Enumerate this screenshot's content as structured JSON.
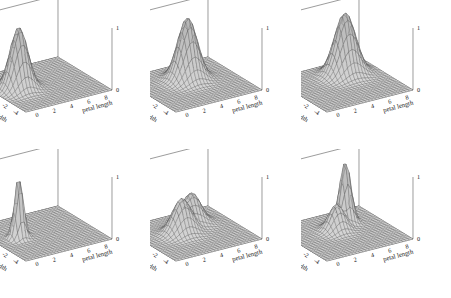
{
  "figure": {
    "background": "#ffffff",
    "rows": 2,
    "cols": 3,
    "line_color": "#4a4a4a",
    "surface_fill": "#d9d9d9",
    "base_fill": "#c9c9c9"
  },
  "axes": {
    "x": {
      "label": "petal length",
      "ticks": [
        "0",
        "2",
        "4",
        "6",
        "8"
      ],
      "range": [
        -1,
        9
      ]
    },
    "y": {
      "label": "petal width",
      "ticks": [
        "4",
        "2",
        "0",
        "-2",
        "-4"
      ],
      "range": [
        -5,
        5
      ]
    },
    "z": {
      "ticks": [
        "1",
        "0"
      ],
      "range": [
        0,
        1
      ]
    },
    "corner_tick": "0"
  },
  "panels": [
    {
      "id": "panel-top-left",
      "species": "Iris setosa",
      "row": 1,
      "col": 1,
      "shape": "unimodal-broad"
    },
    {
      "id": "panel-top-center",
      "species": "Iris versicolor",
      "row": 1,
      "col": 2,
      "shape": "unimodal-broad"
    },
    {
      "id": "panel-top-right",
      "species": "Iris virginica",
      "row": 1,
      "col": 3,
      "shape": "unimodal-broad"
    },
    {
      "id": "panel-bottom-left",
      "species": "Iris setosa",
      "row": 2,
      "col": 1,
      "shape": "unimodal-sharp"
    },
    {
      "id": "panel-bottom-center",
      "species": "Iris versicolor",
      "row": 2,
      "col": 2,
      "shape": "bimodal-ridge"
    },
    {
      "id": "panel-bottom-right",
      "species": "Iris virginica",
      "row": 2,
      "col": 3,
      "shape": "bimodal-peak"
    }
  ],
  "chart_data": {
    "type": "surface",
    "title": "",
    "xlabel": "petal length",
    "ylabel": "petal width",
    "zlabel": "",
    "xlim": [
      -1,
      9
    ],
    "ylim": [
      -5,
      5
    ],
    "zlim": [
      0,
      1
    ],
    "xticks": [
      0,
      2,
      4,
      6,
      8
    ],
    "yticks": [
      4,
      2,
      0,
      -2,
      -4
    ],
    "zticks": [
      0,
      1
    ],
    "grid": true,
    "legend": "none",
    "panel_layout": [
      2,
      3
    ],
    "surfaces": [
      {
        "name": "Iris setosa",
        "panel": "top-left",
        "description": "single smooth peak near petal length 1.5, petal width 0.3, normalized height 1.0",
        "peaks": [
          {
            "x": 1.5,
            "y": 0.3,
            "z": 1.0,
            "sigma_x": 0.9,
            "sigma_y": 0.9
          }
        ]
      },
      {
        "name": "Iris versicolor",
        "panel": "top-center",
        "description": "single smooth peak near petal length 4.3, petal width 1.3, normalized height 1.0",
        "peaks": [
          {
            "x": 4.3,
            "y": 1.3,
            "z": 1.0,
            "sigma_x": 1.0,
            "sigma_y": 1.0
          }
        ]
      },
      {
        "name": "Iris virginica",
        "panel": "top-right",
        "description": "single smooth peak near petal length 5.5, petal width 2.0, normalized height 1.0",
        "peaks": [
          {
            "x": 5.5,
            "y": 2.0,
            "z": 1.0,
            "sigma_x": 1.1,
            "sigma_y": 1.0
          }
        ]
      },
      {
        "name": "Iris setosa",
        "panel": "bottom-left",
        "description": "narrow sharp spike near petal length 1.5, petal width 0.3, normalized height 1.0",
        "peaks": [
          {
            "x": 1.5,
            "y": 0.3,
            "z": 1.0,
            "sigma_x": 0.45,
            "sigma_y": 0.45
          }
        ]
      },
      {
        "name": "Iris versicolor",
        "panel": "bottom-center",
        "description": "broad plateau with two low humps and a central saddle near petal length 4.3, petal width 1.3",
        "peaks": [
          {
            "x": 3.2,
            "y": 0.6,
            "z": 0.55,
            "sigma_x": 1.0,
            "sigma_y": 0.9
          },
          {
            "x": 5.2,
            "y": 2.0,
            "z": 0.5,
            "sigma_x": 1.0,
            "sigma_y": 0.9
          }
        ]
      },
      {
        "name": "Iris virginica",
        "panel": "bottom-right",
        "description": "tall narrow peak with an adjacent lower shoulder near petal length 5.5, petal width 2.0",
        "peaks": [
          {
            "x": 5.6,
            "y": 2.1,
            "z": 1.0,
            "sigma_x": 0.55,
            "sigma_y": 0.6
          },
          {
            "x": 3.9,
            "y": 1.0,
            "z": 0.42,
            "sigma_x": 0.8,
            "sigma_y": 0.8
          }
        ]
      }
    ]
  }
}
